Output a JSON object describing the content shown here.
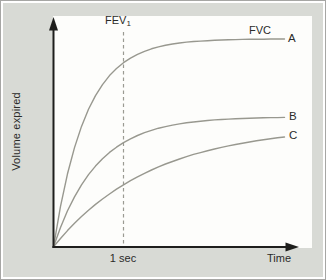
{
  "figure": {
    "y_axis_label": "Volume expired",
    "x_axis_label": "Time",
    "fev_label": {
      "base": "FEV",
      "sub": "1"
    },
    "fvc_label": "FVC",
    "one_sec_label": "1 sec",
    "curve_labels": {
      "a": "A",
      "b": "B",
      "c": "C"
    },
    "colors": {
      "panel_bg": "#d8dad5",
      "plot_bg": "#fdfdfb",
      "curve": "#98988f",
      "dashed": "#9a9a92",
      "axis": "#1e1e1c",
      "text": "#2b2b29",
      "border": "#a6a6a4"
    }
  },
  "chart_data": {
    "type": "line",
    "title": "",
    "xlabel": "Time",
    "ylabel": "Volume expired",
    "x_unit": "seconds",
    "x_range": [
      0,
      3.5
    ],
    "y_range": [
      0,
      1.05
    ],
    "grid": false,
    "legend_position": "right-of-curve-ends",
    "annotations": [
      {
        "label": "FEV1",
        "type": "dashed-vertical-line",
        "x": 1
      },
      {
        "label": "1 sec",
        "type": "x-axis-text",
        "x": 1
      },
      {
        "label": "FVC",
        "type": "text",
        "note": "above plateau of curve A"
      }
    ],
    "x": [
      0,
      0.1,
      0.2,
      0.3,
      0.4,
      0.5,
      0.6,
      0.7,
      0.8,
      0.9,
      1.0,
      1.1,
      1.2,
      1.3,
      1.4,
      1.5,
      1.6,
      1.7,
      1.8,
      1.9,
      2.0,
      2.1,
      2.2,
      2.3,
      2.4,
      2.5,
      2.6,
      2.7,
      2.8,
      2.9,
      3.0,
      3.1,
      3.2,
      3.3
    ],
    "series": [
      {
        "name": "A",
        "values": [
          0,
          0.194,
          0.351,
          0.477,
          0.579,
          0.661,
          0.727,
          0.78,
          0.823,
          0.857,
          0.885,
          0.907,
          0.925,
          0.94,
          0.952,
          0.961,
          0.969,
          0.975,
          0.98,
          0.984,
          0.987,
          0.989,
          0.991,
          0.993,
          0.994,
          0.995,
          0.996,
          0.997,
          0.998,
          0.998,
          0.998,
          0.999,
          0.999,
          0.999
        ]
      },
      {
        "name": "B",
        "values": [
          0,
          0.093,
          0.173,
          0.24,
          0.298,
          0.347,
          0.388,
          0.423,
          0.454,
          0.479,
          0.501,
          0.519,
          0.535,
          0.549,
          0.56,
          0.57,
          0.578,
          0.585,
          0.591,
          0.596,
          0.6,
          0.604,
          0.607,
          0.61,
          0.612,
          0.614,
          0.616,
          0.617,
          0.618,
          0.619,
          0.62,
          0.621,
          0.621,
          0.622
        ]
      },
      {
        "name": "C",
        "values": [
          0,
          0.04,
          0.078,
          0.113,
          0.145,
          0.176,
          0.204,
          0.23,
          0.254,
          0.277,
          0.298,
          0.318,
          0.336,
          0.353,
          0.369,
          0.384,
          0.398,
          0.41,
          0.422,
          0.433,
          0.444,
          0.453,
          0.462,
          0.47,
          0.478,
          0.485,
          0.492,
          0.498,
          0.504,
          0.51,
          0.515,
          0.519,
          0.524,
          0.528
        ]
      }
    ]
  }
}
